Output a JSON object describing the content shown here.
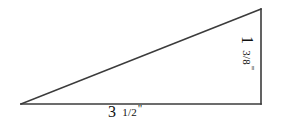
{
  "figure": {
    "name": "right-triangle-with-dimensions",
    "shape": "right triangle",
    "background_color": "#ffffff",
    "stroke_color": "#3b3b3b",
    "stroke_width": 1.6,
    "vertices": {
      "left": [
        21,
        104
      ],
      "bottom_right": [
        261,
        104
      ],
      "top_right": [
        261,
        9
      ]
    },
    "right_angle_at": "bottom-right"
  },
  "labels": {
    "base": {
      "whole": "3",
      "fraction": "1/2",
      "unit_mark": "\"",
      "full_text": "3 1/2\"",
      "position": "below-base",
      "orientation": "horizontal"
    },
    "height": {
      "whole": "1",
      "fraction": "3/8",
      "unit_mark": "\"",
      "full_text": "1 3/8\"",
      "position": "right-of-vertical-leg",
      "orientation": "rotated-90-clockwise"
    }
  },
  "chart_data": {
    "type": "diagram",
    "title": "",
    "shape": "right triangle",
    "measurements": [
      {
        "side": "base",
        "value": 3.5,
        "display": "3 1/2\"",
        "unit": "inch"
      },
      {
        "side": "height",
        "value": 1.375,
        "display": "1 3/8\"",
        "unit": "inch"
      }
    ],
    "hypotenuse_drawn": true,
    "grid": false,
    "legend": null
  }
}
